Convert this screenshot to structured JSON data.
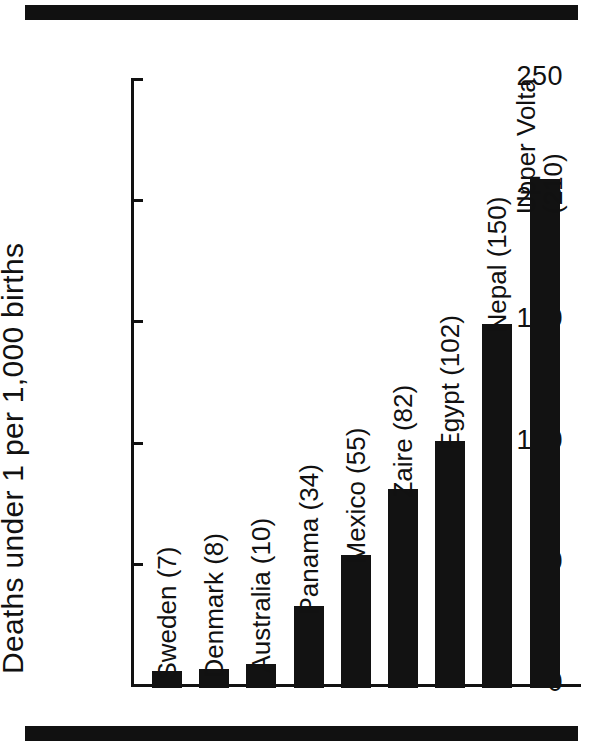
{
  "figure": {
    "top_rule": "top-divider",
    "bottom_rule": "bottom-divider"
  },
  "chart_data": {
    "type": "bar",
    "title": "",
    "xlabel": "",
    "ylabel": "Deaths under 1 per 1,000 births",
    "ylim": [
      0,
      250
    ],
    "yticks": [
      0,
      50,
      100,
      150,
      200,
      250
    ],
    "ytick_labels": [
      "0",
      "50",
      "100",
      "150",
      "200",
      "250"
    ],
    "grid": false,
    "legend": "none",
    "orientation": "vertical",
    "bar_color": "#121212",
    "categories": [
      "Sweden",
      "Denmark",
      "Australia",
      "Panama",
      "Mexico",
      "Zaire",
      "Egypt",
      "Nepal",
      "Upper Volta"
    ],
    "values": [
      7,
      8,
      10,
      34,
      55,
      82,
      102,
      150,
      210
    ],
    "bar_labels": [
      "Sweden (7)",
      "Denmark (8)",
      "Australia (10)",
      "Panama (34)",
      "Mexico (55)",
      "Zaire (82)",
      "Egypt (102)",
      "Nepal (150)",
      "Upper Volta\n(210)"
    ]
  }
}
